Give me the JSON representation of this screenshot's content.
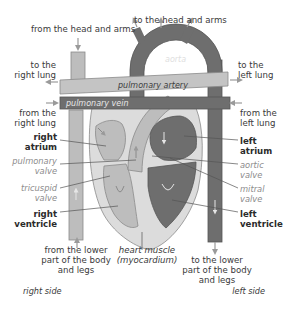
{
  "diagram": {
    "type": "labeled-anatomy-diagram",
    "colors": {
      "oxygen_poor_blood": "#bdbdbd",
      "oxygen_rich_blood": "#6e6e6e",
      "heart_muscle": "#dcdcdc",
      "vessel_outline": "#8a8a8a",
      "arrow": "#9a9a9a",
      "label_text": "#3a3a3a",
      "valve_label_text": "#8c8c8c"
    },
    "vessel_labels": {
      "aorta": "aorta",
      "pulmonary_artery": "pulmonary artery",
      "pulmonary_vein": "pulmonary vein"
    },
    "flow_labels": {
      "from_head_arms": "from the head and arms",
      "to_head_arms": "to the head and arms",
      "to_right_lung": [
        "to the",
        "right lung"
      ],
      "to_left_lung": [
        "to the",
        "left lung"
      ],
      "from_right_lung": [
        "from the",
        "right lung"
      ],
      "from_left_lung": [
        "from the",
        "left lung"
      ],
      "from_lower_body": [
        "from the lower",
        "part of the body",
        "and legs"
      ],
      "to_lower_body": [
        "to the lower",
        "part of the body",
        "and legs"
      ]
    },
    "structure_labels": {
      "right_atrium": [
        "right",
        "atrium"
      ],
      "left_atrium": [
        "left",
        "atrium"
      ],
      "right_ventricle": [
        "right",
        "ventricle"
      ],
      "left_ventricle": [
        "left",
        "ventricle"
      ],
      "heart_muscle": [
        "heart muscle",
        "(myocardium)"
      ]
    },
    "valve_labels": {
      "pulmonary_valve": [
        "pulmonary",
        "valve"
      ],
      "tricuspid_valve": [
        "tricuspid",
        "valve"
      ],
      "aortic_valve": [
        "aortic",
        "valve"
      ],
      "mitral_valve": [
        "mitral",
        "valve"
      ]
    },
    "side_labels": {
      "right": "right side",
      "left": "left side"
    }
  }
}
